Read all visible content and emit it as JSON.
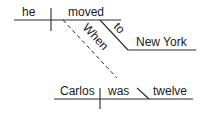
{
  "diagram": {
    "type": "sentence-diagram",
    "main_clause": {
      "subject": "he",
      "verb": "moved",
      "preposition": "to",
      "prep_object": "New York"
    },
    "subordinate_clause": {
      "conjunction": "When",
      "subject": "Carlos",
      "verb": "was",
      "complement": "twelve"
    },
    "colors": {
      "line": "#2a2a2a",
      "text": "#1a1a1a",
      "background": "#ffffff"
    }
  }
}
